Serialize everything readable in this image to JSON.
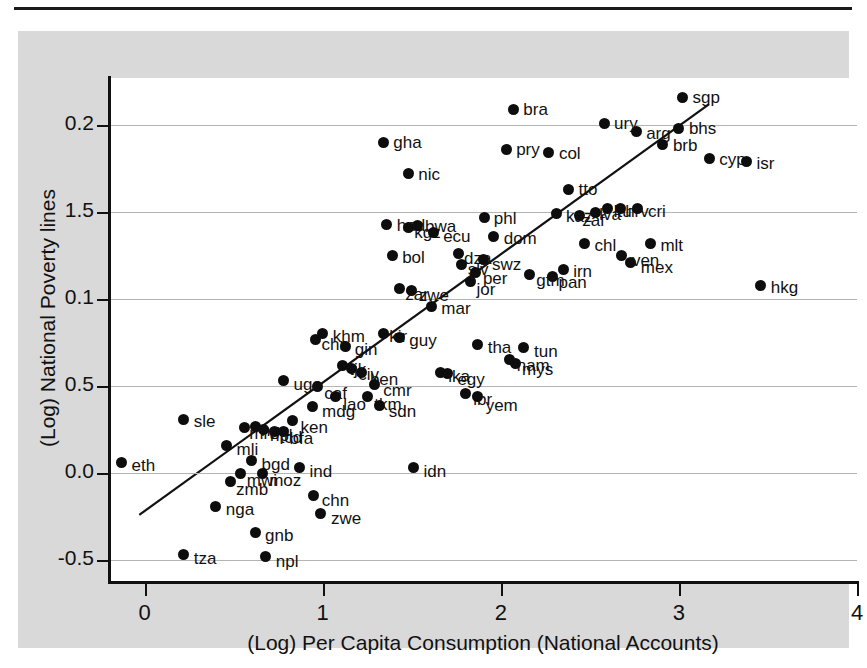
{
  "figure": {
    "x_axis_title": "(Log) Per Capita Consumption (National Accounts)",
    "y_axis_title": "(Log) National Poverty lines",
    "x_ticks": [
      "0",
      "1",
      "2",
      "3",
      "4"
    ],
    "y_ticks": [
      "0.2",
      "1.5",
      "0.1",
      "0.5",
      "0.0",
      "-0.5"
    ],
    "point_color": "#0d0d0d",
    "grid_color": "#b4b4b4",
    "panel_color": "#d9d9d9",
    "plot_color": "#ffffff"
  },
  "chart_data": {
    "type": "scatter",
    "title": "",
    "xlabel": "(Log) Per Capita Consumption (National Accounts)",
    "ylabel": "(Log) National Poverty lines",
    "xlim": [
      -0.2,
      4.0
    ],
    "ylim": [
      -0.62,
      2.27
    ],
    "xticks": [
      0,
      1,
      2,
      3,
      4
    ],
    "yticks": [
      2.0,
      1.5,
      1.0,
      0.5,
      0.0,
      -0.5
    ],
    "ytick_labels": [
      "0.2",
      "1.5",
      "0.1",
      "0.5",
      "0.0",
      "-0.5"
    ],
    "grid": "horizontal",
    "legend": "none",
    "fit_line": {
      "x0": -0.03,
      "y0": -0.24,
      "x1": 3.17,
      "y1": 2.12
    },
    "points": [
      {
        "label": "sgp",
        "x": 3.02,
        "y": 2.16,
        "lx": 10,
        "ly": -8
      },
      {
        "label": "bra",
        "x": 2.07,
        "y": 2.09,
        "lx": 10,
        "ly": -8
      },
      {
        "label": "ury",
        "x": 2.58,
        "y": 2.01,
        "lx": 10,
        "ly": -8
      },
      {
        "label": "arg",
        "x": 2.76,
        "y": 1.96,
        "lx": 10,
        "ly": -7
      },
      {
        "label": "bhs",
        "x": 3.0,
        "y": 1.98,
        "lx": 10,
        "ly": -8
      },
      {
        "label": "brb",
        "x": 2.91,
        "y": 1.89,
        "lx": 10,
        "ly": -7
      },
      {
        "label": "gha",
        "x": 1.34,
        "y": 1.9,
        "lx": 10,
        "ly": -8
      },
      {
        "label": "pry",
        "x": 2.03,
        "y": 1.86,
        "lx": 10,
        "ly": -8
      },
      {
        "label": "col",
        "x": 2.27,
        "y": 1.84,
        "lx": 10,
        "ly": -8
      },
      {
        "label": "cyp",
        "x": 3.17,
        "y": 1.81,
        "lx": 10,
        "ly": -7
      },
      {
        "label": "isr",
        "x": 3.38,
        "y": 1.79,
        "lx": 10,
        "ly": -7
      },
      {
        "label": "nic",
        "x": 1.48,
        "y": 1.72,
        "lx": 10,
        "ly": -8
      },
      {
        "label": "tto",
        "x": 2.38,
        "y": 1.63,
        "lx": 10,
        "ly": -8
      },
      {
        "label": "cri",
        "x": 2.77,
        "y": 1.52,
        "lx": 10,
        "ly": -6
      },
      {
        "label": "ltu",
        "x": 2.6,
        "y": 1.52,
        "lx": 6,
        "ly": -6
      },
      {
        "label": "hrv",
        "x": 2.67,
        "y": 1.52,
        "lx": 5,
        "ly": -6
      },
      {
        "label": "lva",
        "x": 2.53,
        "y": 1.5,
        "lx": 4,
        "ly": -6
      },
      {
        "label": "zaf",
        "x": 2.44,
        "y": 1.48,
        "lx": 3,
        "ly": -3
      },
      {
        "label": "kaz",
        "x": 2.31,
        "y": 1.49,
        "lx": 10,
        "ly": -6
      },
      {
        "label": "phl",
        "x": 1.91,
        "y": 1.47,
        "lx": 9,
        "ly": -7
      },
      {
        "label": "hnd",
        "x": 1.36,
        "y": 1.43,
        "lx": 10,
        "ly": -7
      },
      {
        "label": "kgz",
        "x": 1.48,
        "y": 1.41,
        "lx": 6,
        "ly": -4
      },
      {
        "label": "bwa",
        "x": 1.53,
        "y": 1.42,
        "lx": 8,
        "ly": -8
      },
      {
        "label": "ecu",
        "x": 1.62,
        "y": 1.38,
        "lx": 10,
        "ly": -5
      },
      {
        "label": "dom",
        "x": 1.96,
        "y": 1.36,
        "lx": 10,
        "ly": -6
      },
      {
        "label": "chl",
        "x": 2.47,
        "y": 1.32,
        "lx": 10,
        "ly": -6
      },
      {
        "label": "mlt",
        "x": 2.84,
        "y": 1.32,
        "lx": 10,
        "ly": -6
      },
      {
        "label": "bol",
        "x": 1.39,
        "y": 1.25,
        "lx": 10,
        "ly": -7
      },
      {
        "label": "ven",
        "x": 2.68,
        "y": 1.25,
        "lx": 10,
        "ly": -4
      },
      {
        "label": "mex",
        "x": 2.73,
        "y": 1.21,
        "lx": 10,
        "ly": -3
      },
      {
        "label": "dza",
        "x": 1.76,
        "y": 1.26,
        "lx": 6,
        "ly": -4
      },
      {
        "label": "swz",
        "x": 1.9,
        "y": 1.23,
        "lx": 9,
        "ly": -3
      },
      {
        "label": "slv",
        "x": 1.78,
        "y": 1.2,
        "lx": 6,
        "ly": -3
      },
      {
        "label": "irn",
        "x": 2.35,
        "y": 1.17,
        "lx": 10,
        "ly": -6
      },
      {
        "label": "per",
        "x": 1.86,
        "y": 1.15,
        "lx": 7,
        "ly": -3
      },
      {
        "label": "pan",
        "x": 2.29,
        "y": 1.13,
        "lx": 6,
        "ly": -2
      },
      {
        "label": "gtm",
        "x": 2.16,
        "y": 1.14,
        "lx": 7,
        "ly": -3
      },
      {
        "label": "jor",
        "x": 1.83,
        "y": 1.1,
        "lx": 6,
        "ly": -1
      },
      {
        "label": "zar",
        "x": 1.43,
        "y": 1.06,
        "lx": 6,
        "ly": -3
      },
      {
        "label": "zwe2",
        "x": 1.5,
        "y": 1.05,
        "lx": 7,
        "ly": -3
      },
      {
        "label": "hkg",
        "x": 3.46,
        "y": 1.08,
        "lx": 10,
        "ly": -6
      },
      {
        "label": "mar",
        "x": 1.61,
        "y": 0.96,
        "lx": 10,
        "ly": -6
      },
      {
        "label": "khm",
        "x": 1.0,
        "y": 0.8,
        "lx": 10,
        "ly": -6
      },
      {
        "label": "kir",
        "x": 1.34,
        "y": 0.8,
        "lx": 6,
        "ly": -6
      },
      {
        "label": "guy",
        "x": 1.43,
        "y": 0.78,
        "lx": 10,
        "ly": -5
      },
      {
        "label": "tha",
        "x": 1.87,
        "y": 0.74,
        "lx": 10,
        "ly": -5
      },
      {
        "label": "tun",
        "x": 2.13,
        "y": 0.72,
        "lx": 10,
        "ly": -5
      },
      {
        "label": "chn",
        "x": 0.96,
        "y": 0.77,
        "lx": 6,
        "ly": -3
      },
      {
        "label": "gin",
        "x": 1.13,
        "y": 0.73,
        "lx": 9,
        "ly": -5
      },
      {
        "label": "nam",
        "x": 2.05,
        "y": 0.65,
        "lx": 7,
        "ly": -3
      },
      {
        "label": "mys",
        "x": 2.08,
        "y": 0.63,
        "lx": 7,
        "ly": -2
      },
      {
        "label": "tjk",
        "x": 1.11,
        "y": 0.62,
        "lx": 7,
        "ly": -4
      },
      {
        "label": "civ",
        "x": 1.16,
        "y": 0.6,
        "lx": 7,
        "ly": -3
      },
      {
        "label": "ben",
        "x": 1.22,
        "y": 0.58,
        "lx": 8,
        "ly": -1
      },
      {
        "label": "uga",
        "x": 0.78,
        "y": 0.53,
        "lx": 10,
        "ly": -5
      },
      {
        "label": "egy",
        "x": 1.7,
        "y": 0.57,
        "lx": 10,
        "ly": -3
      },
      {
        "label": "lka",
        "x": 1.66,
        "y": 0.58,
        "lx": 8,
        "ly": -4
      },
      {
        "label": "caf",
        "x": 0.97,
        "y": 0.5,
        "lx": 7,
        "ly": -1
      },
      {
        "label": "cmr",
        "x": 1.29,
        "y": 0.51,
        "lx": 9,
        "ly": -2
      },
      {
        "label": "lao",
        "x": 1.07,
        "y": 0.44,
        "lx": 8,
        "ly": -1
      },
      {
        "label": "tkm",
        "x": 1.25,
        "y": 0.44,
        "lx": 7,
        "ly": -1
      },
      {
        "label": "lbr",
        "x": 1.8,
        "y": 0.46,
        "lx": 8,
        "ly": -2
      },
      {
        "label": "yem",
        "x": 1.87,
        "y": 0.44,
        "lx": 8,
        "ly": 0
      },
      {
        "label": "sdn",
        "x": 1.32,
        "y": 0.39,
        "lx": 9,
        "ly": -2
      },
      {
        "label": "mdg",
        "x": 0.94,
        "y": 0.38,
        "lx": 10,
        "ly": -4
      },
      {
        "label": "sle",
        "x": 0.22,
        "y": 0.31,
        "lx": 10,
        "ly": -6
      },
      {
        "label": "ken",
        "x": 0.83,
        "y": 0.3,
        "lx": 8,
        "ly": -2
      },
      {
        "label": "nga2",
        "x": 0.62,
        "y": 0.27,
        "lx": 6,
        "ly": -4
      },
      {
        "label": "npl2",
        "x": 0.67,
        "y": 0.25,
        "lx": 6,
        "ly": -3
      },
      {
        "label": "tcd",
        "x": 0.73,
        "y": 0.24,
        "lx": 5,
        "ly": -2
      },
      {
        "label": "bfa",
        "x": 0.78,
        "y": 0.24,
        "lx": 6,
        "ly": -1
      },
      {
        "label": "mrt",
        "x": 0.56,
        "y": 0.26,
        "lx": 5,
        "ly": -3
      },
      {
        "label": "mli",
        "x": 0.46,
        "y": 0.16,
        "lx": 10,
        "ly": -4
      },
      {
        "label": "eth",
        "x": -0.13,
        "y": 0.06,
        "lx": 10,
        "ly": -6
      },
      {
        "label": "bgd",
        "x": 0.6,
        "y": 0.07,
        "lx": 10,
        "ly": -5
      },
      {
        "label": "ind",
        "x": 0.87,
        "y": 0.03,
        "lx": 10,
        "ly": -5
      },
      {
        "label": "idn",
        "x": 1.51,
        "y": 0.03,
        "lx": 10,
        "ly": -5
      },
      {
        "label": "mwi",
        "x": 0.54,
        "y": 0.0,
        "lx": 6,
        "ly": -1
      },
      {
        "label": "moz",
        "x": 0.66,
        "y": 0.0,
        "lx": 7,
        "ly": -1
      },
      {
        "label": "zmb",
        "x": 0.48,
        "y": -0.05,
        "lx": 6,
        "ly": -1
      },
      {
        "label": "chn2",
        "x": 0.95,
        "y": -0.13,
        "lx": 8,
        "ly": -4
      },
      {
        "label": "nga",
        "x": 0.4,
        "y": -0.19,
        "lx": 10,
        "ly": -5
      },
      {
        "label": "zwe",
        "x": 0.99,
        "y": -0.23,
        "lx": 10,
        "ly": -3
      },
      {
        "label": "gnb",
        "x": 0.62,
        "y": -0.34,
        "lx": 10,
        "ly": -5
      },
      {
        "label": "tza",
        "x": 0.22,
        "y": -0.47,
        "lx": 10,
        "ly": -5
      },
      {
        "label": "npl",
        "x": 0.68,
        "y": -0.48,
        "lx": 10,
        "ly": -4
      }
    ],
    "label_overrides": {
      "zwe2": "zwe",
      "nga2": "nga",
      "npl2": "npl",
      "chn2": "chn"
    }
  }
}
